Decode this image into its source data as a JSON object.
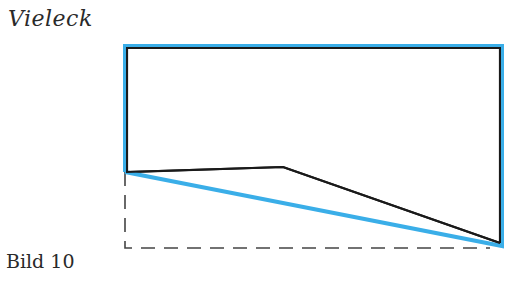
{
  "title": "Vieleck",
  "caption": "Bild 10",
  "colors": {
    "highlight": "#3aaee8",
    "outline": "#1a1a1a",
    "dashed": "#444444",
    "text": "#2a2a2a"
  },
  "figure": {
    "polygon_vertices": [
      [
        127,
        48
      ],
      [
        500,
        48
      ],
      [
        500,
        243
      ],
      [
        283,
        167
      ],
      [
        127,
        172
      ]
    ],
    "highlight_path": [
      [
        125,
        172
      ],
      [
        125,
        46
      ],
      [
        502,
        46
      ],
      [
        502,
        246
      ],
      [
        125,
        172
      ]
    ],
    "dashed_path": [
      [
        125,
        172
      ],
      [
        125,
        248
      ],
      [
        490,
        248
      ]
    ]
  }
}
